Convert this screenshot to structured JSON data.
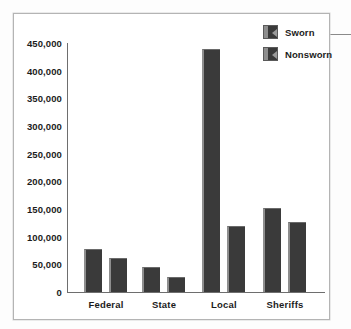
{
  "chart_data": {
    "type": "bar",
    "title": "",
    "subtitle": "",
    "xlabel": "",
    "ylabel": "",
    "categories": [
      "Federal",
      "State",
      "Local",
      "Sheriffs"
    ],
    "series": [
      {
        "name": "Sworn",
        "values": [
          78000,
          45000,
          440000,
          152000
        ]
      },
      {
        "name": "Nonsworn",
        "values": [
          62000,
          28000,
          120000,
          126000
        ]
      }
    ],
    "ylim": [
      0,
      450000
    ],
    "ytick_step": 50000,
    "ytick_labels": [
      "450,000",
      "400,000",
      "350,000",
      "300,000",
      "250,000",
      "200,000",
      "150,000",
      "100,000",
      "50,000",
      "0"
    ],
    "ytick_values": [
      450000,
      400000,
      350000,
      300000,
      250000,
      200000,
      150000,
      100000,
      50000,
      0
    ],
    "grid": false,
    "legend_position": "top-right",
    "bar_color": "#3a3a3a",
    "bar_highlight_color": "#8e8e8e",
    "axis_color": "#6e6e6e",
    "frame_color": "#b4b4b4",
    "text_color": "#1c1c1c"
  },
  "legend": {
    "entries": [
      {
        "label": "Sworn",
        "swatch": "legend-swatch-sworn"
      },
      {
        "label": "Nonsworn",
        "swatch": "legend-swatch-nonsworn"
      }
    ]
  }
}
